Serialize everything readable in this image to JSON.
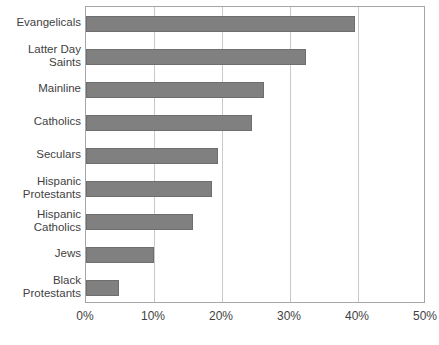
{
  "chart_data": {
    "type": "bar",
    "orientation": "horizontal",
    "title": "",
    "subtitle": "",
    "xlabel": "",
    "ylabel": "",
    "xlim": [
      0,
      50
    ],
    "xtick_labels": [
      "0%",
      "10%",
      "20%",
      "30%",
      "40%",
      "50%"
    ],
    "xtick_values": [
      0,
      10,
      20,
      30,
      40,
      50
    ],
    "grid": true,
    "legend": false,
    "legend_position": "none",
    "bar_color": "#808080",
    "bar_border_color": "#6e6e6e",
    "gridline_color": "#c9c9c9",
    "plot_border_color": "#a6a6a6",
    "categories": [
      "Evangelicals",
      "Latter Day\nSaints",
      "Mainline",
      "Catholics",
      "Seculars",
      "Hispanic\nProtestants",
      "Hispanic\nCatholics",
      "Jews",
      "Black\nProtestants"
    ],
    "values": [
      39.5,
      32.4,
      26.2,
      24.4,
      19.4,
      18.5,
      15.7,
      10.0,
      4.9
    ]
  }
}
